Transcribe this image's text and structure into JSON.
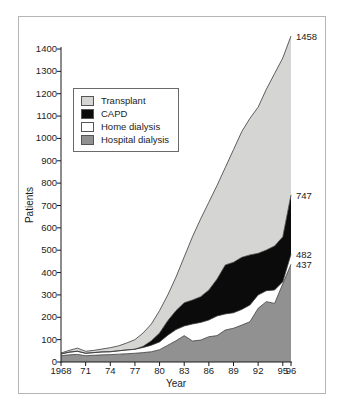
{
  "chart_data": {
    "type": "area",
    "stacked": true,
    "title": "",
    "xlabel": "Year",
    "ylabel": "Patients",
    "ylim": [
      0,
      1400
    ],
    "x_range": [
      1968,
      1996
    ],
    "grid": false,
    "legend_position": "upper-left",
    "y_ticks": [
      0,
      100,
      200,
      300,
      400,
      500,
      600,
      700,
      800,
      900,
      1000,
      1100,
      1200,
      1300,
      1400
    ],
    "x_ticks": [
      {
        "year": 1968,
        "label": "1968"
      },
      {
        "year": 1971,
        "label": "71"
      },
      {
        "year": 1974,
        "label": "74"
      },
      {
        "year": 1977,
        "label": "77"
      },
      {
        "year": 1980,
        "label": "80"
      },
      {
        "year": 1983,
        "label": "83"
      },
      {
        "year": 1986,
        "label": "86"
      },
      {
        "year": 1989,
        "label": "89"
      },
      {
        "year": 1992,
        "label": "92"
      },
      {
        "year": 1995,
        "label": "95"
      },
      {
        "year": 1996,
        "label": "96"
      }
    ],
    "years": [
      1968,
      1969,
      1970,
      1971,
      1972,
      1973,
      1974,
      1975,
      1976,
      1977,
      1978,
      1979,
      1980,
      1981,
      1982,
      1983,
      1984,
      1985,
      1986,
      1987,
      1988,
      1989,
      1990,
      1991,
      1992,
      1993,
      1994,
      1995,
      1996
    ],
    "series": [
      {
        "name": "Hospital dialysis",
        "color": "#919191",
        "values": [
          28,
          32,
          34,
          28,
          30,
          32,
          33,
          35,
          37,
          39,
          42,
          46,
          55,
          75,
          95,
          118,
          94,
          98,
          113,
          118,
          143,
          151,
          165,
          180,
          240,
          270,
          262,
          350,
          437
        ]
      },
      {
        "name": "Home dialysis",
        "color": "#ffffff",
        "values": [
          8,
          12,
          14,
          11,
          12,
          13,
          13,
          15,
          17,
          18,
          23,
          29,
          35,
          45,
          50,
          43,
          76,
          79,
          75,
          88,
          72,
          69,
          70,
          75,
          60,
          49,
          60,
          9,
          45
        ]
      },
      {
        "name": "CAPD",
        "color": "#0b0b0b",
        "values": [
          0,
          0,
          0,
          0,
          0,
          0,
          0,
          0,
          0,
          0,
          5,
          20,
          40,
          65,
          85,
          104,
          107,
          115,
          134,
          165,
          219,
          226,
          233,
          224,
          186,
          182,
          197,
          201,
          265
        ]
      },
      {
        "name": "Transplant",
        "color": "#d5d5d3",
        "values": [
          4,
          8,
          14,
          9,
          10,
          13,
          18,
          22,
          31,
          43,
          60,
          75,
          100,
          115,
          150,
          205,
          283,
          348,
          393,
          419,
          436,
          504,
          562,
          611,
          654,
          719,
          771,
          800,
          711
        ]
      }
    ],
    "legend": {
      "items": [
        {
          "label": "Transplant",
          "color": "#d5d5d3"
        },
        {
          "label": "CAPD",
          "color": "#0b0b0b"
        },
        {
          "label": "Home dialysis",
          "color": "#ffffff"
        },
        {
          "label": "Hospital dialysis",
          "color": "#919191"
        }
      ]
    },
    "end_annotations": [
      {
        "text": "1458",
        "value": 1458
      },
      {
        "text": "747",
        "value": 747
      },
      {
        "text": "482",
        "value": 482
      },
      {
        "text": "437",
        "value": 437
      }
    ],
    "colors": {
      "outline": "#3a3a3a",
      "axis": "#1a1a1a",
      "text": "#1c1c1c",
      "frame_border": "#b5b5b5",
      "background": "#ffffff"
    }
  }
}
